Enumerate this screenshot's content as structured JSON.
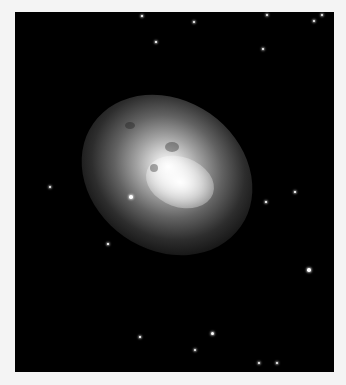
{
  "image": {
    "subject": "elliptical-galaxy",
    "background_color": "#000000",
    "page_color": "#f4f4f4",
    "frame": {
      "left": 15,
      "top": 12,
      "width": 319,
      "height": 360
    }
  },
  "stars": [
    {
      "x": 252,
      "y": 3,
      "r": 1.2
    },
    {
      "x": 307,
      "y": 3,
      "r": 1
    },
    {
      "x": 179,
      "y": 10,
      "r": 1
    },
    {
      "x": 299,
      "y": 9,
      "r": 1
    },
    {
      "x": 141,
      "y": 30,
      "r": 0.8
    },
    {
      "x": 248,
      "y": 37,
      "r": 1
    },
    {
      "x": 35,
      "y": 175,
      "r": 1.2
    },
    {
      "x": 116,
      "y": 185,
      "r": 1.8
    },
    {
      "x": 294,
      "y": 258,
      "r": 1.8
    },
    {
      "x": 197,
      "y": 321,
      "r": 1.5
    },
    {
      "x": 127,
      "y": 4,
      "r": 0.8
    },
    {
      "x": 93,
      "y": 232,
      "r": 0.8
    },
    {
      "x": 180,
      "y": 338,
      "r": 1
    },
    {
      "x": 244,
      "y": 351,
      "r": 1
    },
    {
      "x": 262,
      "y": 351,
      "r": 1
    },
    {
      "x": 251,
      "y": 190,
      "r": 0.8
    },
    {
      "x": 280,
      "y": 180,
      "r": 0.8
    },
    {
      "x": 125,
      "y": 325,
      "r": 0.8
    }
  ]
}
